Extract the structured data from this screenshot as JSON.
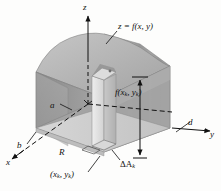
{
  "figure": {
    "background_color": "#fdfdfc",
    "ink_color": "#111111"
  },
  "labels": {
    "z_axis": "z",
    "y_axis": "y",
    "x_axis": "x",
    "surface_equation": "z = f(x, y)",
    "prism_height": "f(x",
    "prism_height_sub1": "k",
    "prism_height_mid": ", y",
    "prism_height_sub2": "k",
    "prism_height_end": ")",
    "edge_a": "a",
    "edge_b": "b",
    "edge_d": "d",
    "region": "R",
    "area_element": "ΔA",
    "area_element_sub": "k",
    "sample_point_open": "(x",
    "sample_point_sub1": "k",
    "sample_point_mid": ", y",
    "sample_point_sub2": "k",
    "sample_point_close": ")"
  },
  "colors": {
    "surface_top": "#b9b9b9",
    "face_left_dark": "#8e8e8e",
    "face_front": "#a8a8a8",
    "face_right": "#9d9d9d",
    "base_region": "#cfcfcf",
    "prism_light": "#e2e2e2",
    "prism_shade": "#c3c3c3",
    "outline": "#6a6a6a",
    "axis": "#111111"
  },
  "geometry": {
    "origin": [
      88,
      104
    ],
    "z_axis_tip": [
      88,
      14
    ],
    "y_axis_tip": [
      214,
      130
    ],
    "x_axis_tip": [
      10,
      160
    ],
    "prism_base_center": [
      104,
      152
    ],
    "prism_top_center": [
      104,
      70
    ]
  }
}
